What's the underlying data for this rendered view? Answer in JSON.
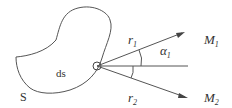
{
  "diagram": {
    "region_label": "S",
    "element_label": "ds",
    "vectors": [
      {
        "label": "r",
        "subscript": "1",
        "target": "M",
        "target_subscript": "1"
      },
      {
        "label": "r",
        "subscript": "2",
        "target": "M",
        "target_subscript": "2"
      }
    ],
    "angle_label": "α",
    "angle_subscript": "1",
    "colors": {
      "stroke": "#555555",
      "text": "#333333",
      "background": "#ffffff"
    }
  }
}
